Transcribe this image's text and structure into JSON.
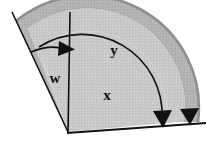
{
  "figure": {
    "name": "angular-sector-diagram",
    "background_color": "#ffffff",
    "labels": {
      "w": "w",
      "x": "x",
      "y": "y"
    },
    "colors": {
      "inner_sector_fill": "#c9c9c9",
      "outer_band_fill": "#b3b3b3",
      "outer_band_edge": "#9a9a9a",
      "stroke": "#111111",
      "arrow_fill": "#111111",
      "label_color": "#111111",
      "background": "#ffffff"
    },
    "geometry": {
      "vertex": {
        "x": 68,
        "y": 132
      },
      "inner_radius_arc_start": {
        "x": 70,
        "y": 43
      },
      "inner_radius_arc_end": {
        "x": 166,
        "y": 126
      },
      "outer_band_outer_radius": 112,
      "outer_band_inner_radius": 98,
      "vertical_line": {
        "x1": 70,
        "y1": 12,
        "x2": 68,
        "y2": 132
      },
      "left_diagonal": {
        "x1": 16,
        "y1": 21,
        "x2": 68,
        "y2": 132
      },
      "baseline": {
        "x1": 68,
        "y1": 132,
        "x2": 205,
        "y2": 122
      }
    },
    "arrows": [
      {
        "name": "w-arrow",
        "direction": "right",
        "from": {
          "x": 34,
          "y": 55
        },
        "to": {
          "x": 70,
          "y": 50
        }
      },
      {
        "name": "y-arc-arrow",
        "direction": "down",
        "tip": {
          "x": 163,
          "y": 125
        }
      },
      {
        "name": "outer-band-arrow",
        "direction": "down",
        "tip": {
          "x": 190,
          "y": 123
        }
      }
    ],
    "label_positions": {
      "w": {
        "x": 55,
        "y": 79
      },
      "x": {
        "x": 107,
        "y": 96
      },
      "y": {
        "x": 114,
        "y": 51
      }
    }
  }
}
